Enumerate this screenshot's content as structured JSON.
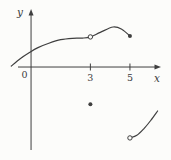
{
  "figure": {
    "background": "#fcfcfa",
    "ink_color": "#3f3f3f",
    "kind": "piecewise function graph with open and closed points at x = 3 and x = 5"
  },
  "chart_data": {
    "type": "line",
    "title": "",
    "xlabel": "x",
    "ylabel": "y",
    "origin_label": "0",
    "grid": false,
    "legend": false,
    "x_ticks": [
      {
        "value": 3,
        "label": "3"
      },
      {
        "value": 5,
        "label": "5"
      }
    ],
    "x_range": [
      -0.66,
      6.52
    ],
    "y_range": [
      -4.19,
      2.88
    ],
    "series": [
      {
        "name": "upper-branch",
        "points": [
          [
            -1.0,
            0.05
          ],
          [
            -0.55,
            0.42
          ],
          [
            -0.1,
            0.72
          ],
          [
            0.35,
            0.98
          ],
          [
            0.9,
            1.2
          ],
          [
            1.5,
            1.38
          ],
          [
            2.1,
            1.45
          ],
          [
            2.6,
            1.46
          ],
          [
            3.0,
            1.52
          ],
          [
            3.5,
            1.75
          ],
          [
            4.15,
            2.02
          ],
          [
            4.6,
            1.9
          ],
          [
            5.0,
            1.57
          ]
        ]
      },
      {
        "name": "lower-right-branch",
        "points": [
          [
            5.0,
            -3.58
          ],
          [
            5.35,
            -3.45
          ],
          [
            5.7,
            -3.12
          ],
          [
            6.05,
            -2.7
          ],
          [
            6.4,
            -2.22
          ]
        ]
      }
    ],
    "open_points": [
      [
        3.0,
        1.52
      ],
      [
        5.0,
        -3.58
      ]
    ],
    "closed_points": [
      [
        5.0,
        1.57
      ],
      [
        3.0,
        -1.88
      ]
    ]
  }
}
